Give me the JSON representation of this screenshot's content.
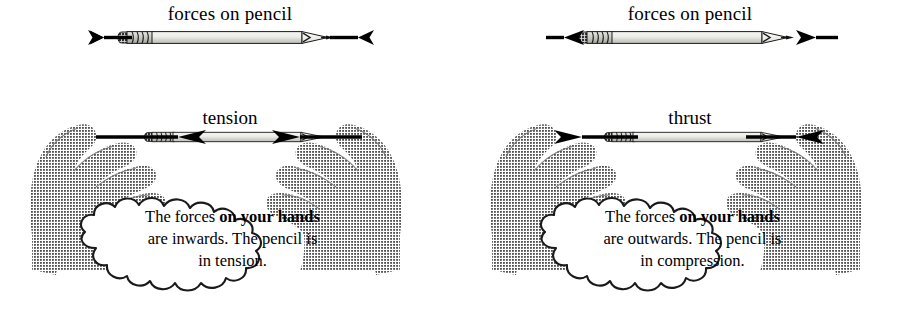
{
  "figure": {
    "type": "physics-force-diagram"
  },
  "colors": {
    "ink": "#000000",
    "background": "#ffffff",
    "hand_gray": "#9a9a9a",
    "hand_gray_dark": "#6f6f6f",
    "pencil_body": "#e8e8e4",
    "pencil_body_shade": "#c9c9c4",
    "ferrule": "#b9b9b4",
    "eraser": "#c0bfbb"
  },
  "panels": [
    {
      "id": "tension",
      "top_caption": "forces on pencil",
      "top_force_direction": "outwards",
      "mid_label": "tension",
      "mid_force_direction": "inwards",
      "cloud_lines": [
        {
          "pre": "The forces ",
          "bold": "on your hands",
          "post": ""
        },
        {
          "pre": "are inwards. The pencil is",
          "bold": "",
          "post": ""
        },
        {
          "pre": "in tension.",
          "bold": "",
          "post": ""
        }
      ],
      "cloud_text_plain": "The forces on your hands are inwards. The pencil is in tension."
    },
    {
      "id": "compression",
      "top_caption": "forces on pencil",
      "top_force_direction": "inwards",
      "mid_label": "thrust",
      "mid_force_direction": "outwards",
      "cloud_lines": [
        {
          "pre": "The forces ",
          "bold": "on your hands",
          "post": ""
        },
        {
          "pre": "are outwards. The pencil is",
          "bold": "",
          "post": ""
        },
        {
          "pre": "in compression.",
          "bold": "",
          "post": ""
        }
      ],
      "cloud_text_plain": "The forces on your hands are outwards. The pencil is in compression."
    }
  ],
  "icons": {
    "pencil": "pencil-icon",
    "hand_left": "hand-left-icon",
    "hand_right": "hand-right-icon",
    "arrow_left": "arrow-left-icon",
    "arrow_right": "arrow-right-icon",
    "cloud": "thought-cloud-icon"
  }
}
